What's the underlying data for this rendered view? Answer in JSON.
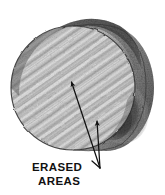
{
  "figure": {
    "medium": "pencil-sketch-halftone",
    "background_color": "#ffffff",
    "ink_color": "#1a1a1a",
    "annotation": {
      "lines": [
        "ERASED",
        "AREAS"
      ],
      "line1": "ERASED",
      "line2": "AREAS",
      "arrow_count": 2,
      "leader_junction": {
        "x": 100,
        "y": 168
      },
      "arrows": [
        {
          "name": "arrow-upper",
          "tip_x": 71,
          "tip_y": 81,
          "tail_x": 100,
          "tail_y": 168
        },
        {
          "name": "arrow-lower",
          "tip_x": 97,
          "tip_y": 120,
          "tail_x": 100,
          "tail_y": 168
        }
      ]
    },
    "object": {
      "name": "cylinder",
      "front_face": {
        "center_x": 73,
        "center_y": 88,
        "radius_x": 62,
        "radius_y": 62,
        "hatch_angle_deg": 35,
        "fill_tone": "#b9b9b9"
      },
      "body": {
        "name": "cylinder-side",
        "shade_tone": "#4a4a4a",
        "highlight_tone": "#cfcfcf"
      }
    }
  }
}
